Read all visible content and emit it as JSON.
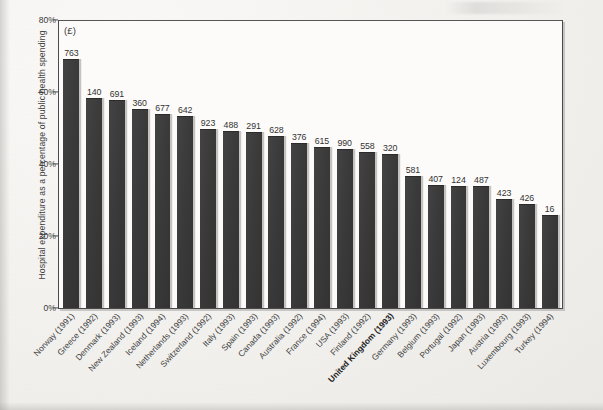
{
  "chart_data": {
    "type": "bar",
    "title": "",
    "subtitle": "",
    "xlabel": "",
    "ylabel": "Hospital expenditure as a percentage of public health spending",
    "ylim": [
      0,
      80
    ],
    "ytick_labels": [
      "0%",
      "20%",
      "40%",
      "60%",
      "80%"
    ],
    "ytick_values": [
      0,
      20,
      40,
      60,
      80
    ],
    "grid": false,
    "legend": null,
    "annotations": [
      {
        "name": "currency-unit",
        "text": "(£)"
      }
    ],
    "bar_color": "#3b3b3b",
    "categories": [
      "Norway (1991)",
      "Greece (1992)",
      "Denmark (1993)",
      "New Zealand (1993)",
      "Iceland (1994)",
      "Netherlands (1993)",
      "Switzerland (1992)",
      "Italy (1993)",
      "Spain (1993)",
      "Canada (1993)",
      "Australia (1992)",
      "France (1994)",
      "USA (1993)",
      "Finland (1992)",
      "United Kingdom (1993)",
      "Germany (1993)",
      "Belgium (1993)",
      "Portugal (1992)",
      "Japan (1993)",
      "Austria (1993)",
      "Luxembourg (1993)",
      "Turkey (1994)"
    ],
    "values": [
      69,
      58,
      57.5,
      55,
      53.5,
      53,
      49.5,
      49,
      48.5,
      47.5,
      45.5,
      44.5,
      44,
      43,
      42.5,
      36.5,
      34,
      33.5,
      33.5,
      30,
      28.5,
      25.5
    ],
    "data_labels": [
      "763",
      "140",
      "691",
      "360",
      "677",
      "642",
      "923",
      "488",
      "291",
      "628",
      "376",
      "615",
      "990",
      "558",
      "320",
      "581",
      "407",
      "124",
      "487",
      "423",
      "426",
      "16"
    ],
    "highlighted_category": "United Kingdom (1993)",
    "data_label_unit": "£"
  }
}
